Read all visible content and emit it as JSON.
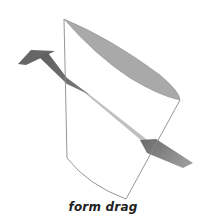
{
  "diagram": {
    "caption": "form drag",
    "elements": {
      "body": "truncated-cylinder",
      "flow": "arrow-through-body"
    },
    "colors": {
      "background": "#ffffff",
      "outline": "#8a8a8a",
      "top_surface": "#a9a9a9",
      "arrow": "#6e6e6e",
      "caption_text": "#222222"
    }
  }
}
